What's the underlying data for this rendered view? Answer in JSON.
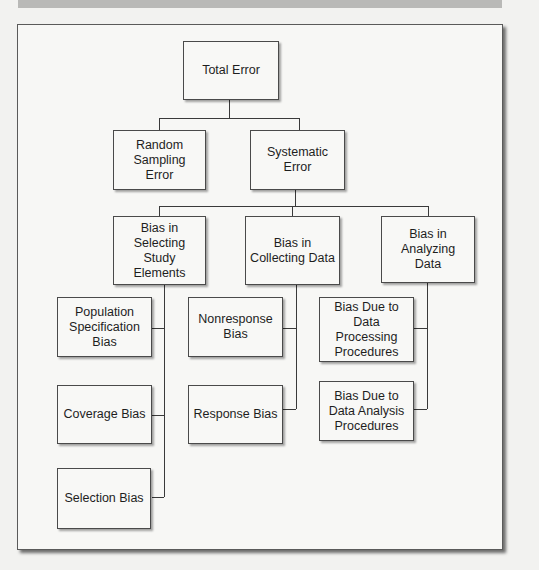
{
  "diagram": {
    "type": "hierarchy-tree",
    "root": {
      "label": "Total Error"
    },
    "level1": [
      {
        "id": "random",
        "label": "Random\nSampling Error"
      },
      {
        "id": "systematic",
        "label": "Systematic\nError"
      }
    ],
    "level2": [
      {
        "id": "selecting",
        "label": "Bias in\nSelecting Study\nElements"
      },
      {
        "id": "collecting",
        "label": "Bias in\nCollecting Data"
      },
      {
        "id": "analyzing",
        "label": "Bias in\nAnalyzing Data"
      }
    ],
    "level3": {
      "selecting": [
        {
          "label": "Population\nSpecification\nBias"
        },
        {
          "label": "Coverage Bias"
        },
        {
          "label": "Selection Bias"
        }
      ],
      "collecting": [
        {
          "label": "Nonresponse\nBias"
        },
        {
          "label": "Response Bias"
        }
      ],
      "analyzing": [
        {
          "label": "Bias Due to\nData\nProcessing\nProcedures"
        },
        {
          "label": "Bias Due to\nData Analysis\nProcedures"
        }
      ]
    }
  }
}
